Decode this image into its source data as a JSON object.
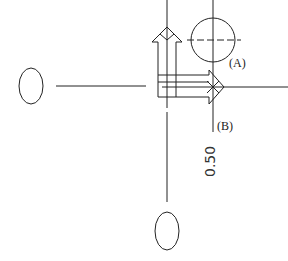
{
  "diagram": {
    "labels": {
      "a": "(A)",
      "b": "(B)",
      "dimension": "0.50"
    },
    "colors": {
      "stroke": "#222222",
      "background": "#ffffff"
    },
    "elements": [
      "left-oval",
      "bottom-oval",
      "vertical-arrow-up",
      "horizontal-arrow-right",
      "circle-a-with-crosshair",
      "point-b-x-mark",
      "dimension-line"
    ]
  }
}
